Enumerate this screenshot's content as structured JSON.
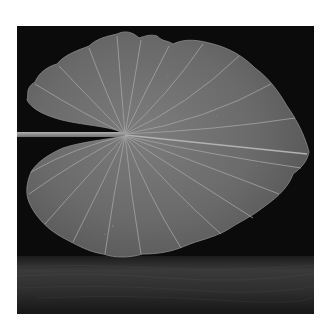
{
  "image": {
    "subject": "Large heart-shaped leaf with radiating veins on a long stem, floating above a textured surface against a black background",
    "style": "Monochrome photograph",
    "colors": {
      "page_background": "#ffffff",
      "photo_background": "#0b0b0b",
      "leaf_fill": "#6a6a6a",
      "leaf_highlight": "#8a8a8a",
      "vein": "#a8a8a8",
      "stem": "#9a9a9a",
      "ground_top": "#2a2a2a",
      "ground_bottom": "#1a1a1a"
    }
  }
}
